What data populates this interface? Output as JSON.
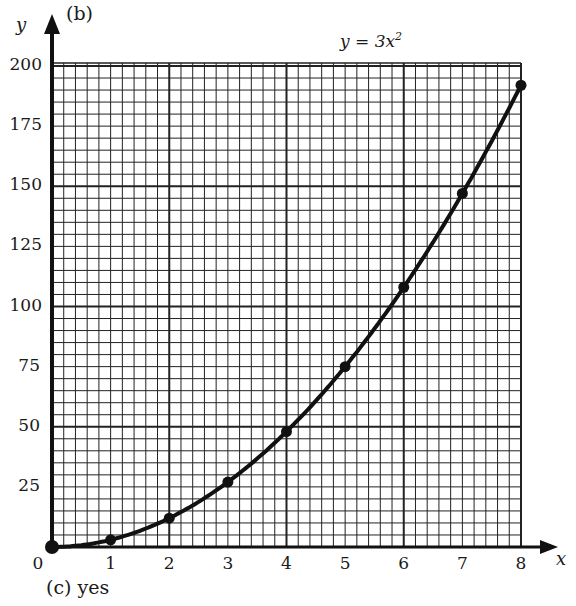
{
  "labels": {
    "part": "(b)",
    "y_axis": "y",
    "x_axis": "x",
    "equation_prefix": "y = 3x",
    "equation_exponent": "2",
    "answer": "(c)  yes"
  },
  "chart_data": {
    "type": "line",
    "xlabel": "x",
    "ylabel": "y",
    "xlim": [
      0,
      8
    ],
    "ylim": [
      0,
      200
    ],
    "grid": true,
    "x_ticks": [
      "0",
      "1",
      "2",
      "3",
      "4",
      "5",
      "6",
      "7",
      "8"
    ],
    "y_ticks": [
      "25",
      "50",
      "75",
      "100",
      "125",
      "150",
      "175",
      "200"
    ],
    "series": [
      {
        "name": "y = 3x^2",
        "x": [
          0,
          1,
          2,
          3,
          4,
          5,
          6,
          7,
          8
        ],
        "values": [
          0,
          3,
          12,
          27,
          48,
          75,
          108,
          147,
          192
        ],
        "markers": true,
        "smooth": true
      }
    ],
    "annotations": [
      "(b)",
      "(c) yes"
    ]
  }
}
